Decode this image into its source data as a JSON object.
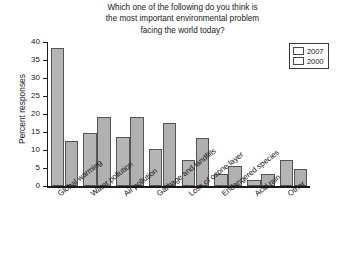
{
  "chart_data": {
    "type": "bar",
    "title": "Which one of the following do you think is\nthe most important environmental problem\nfacing the world today?",
    "xlabel": "",
    "ylabel": "Percent responses",
    "ylim": [
      0,
      40
    ],
    "yticks": [
      0,
      5,
      10,
      15,
      20,
      25,
      30,
      35,
      40
    ],
    "grid": false,
    "legend_position": "top-right",
    "categories": [
      "Global warming",
      "Water pollution",
      "Air pollution",
      "Garbage and landfills",
      "Loss of ozone layer",
      "Endangered species",
      "Acid rain",
      "Other"
    ],
    "series": [
      {
        "name": "2007",
        "color": "#b5b5b5",
        "values": [
          38.2,
          14.6,
          13.5,
          10.2,
          7.3,
          3.2,
          1.7,
          7.2
        ]
      },
      {
        "name": "2000",
        "color": "#b0b0b0",
        "values": [
          12.4,
          19.3,
          19.3,
          17.4,
          13.4,
          5.5,
          3.2,
          4.7
        ]
      }
    ]
  },
  "legend": {
    "items": [
      {
        "label": "2007"
      },
      {
        "label": "2000"
      }
    ]
  },
  "colors": {
    "bar_2007": "#b5b5b5",
    "bar_2000": "#b0b0b0",
    "axis": "#1a1a1a",
    "background": "#ffffff"
  }
}
